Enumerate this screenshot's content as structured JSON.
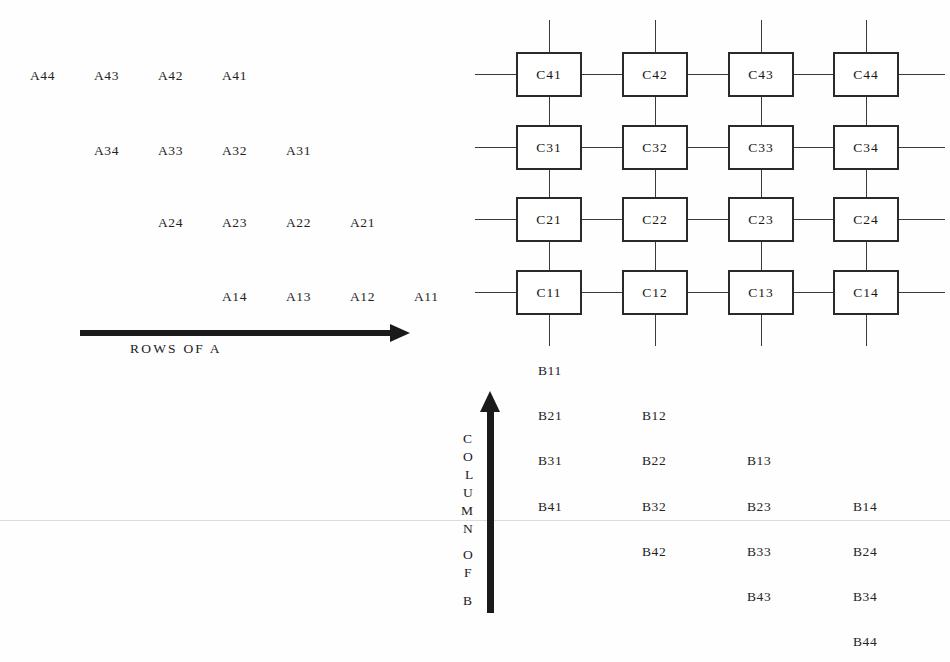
{
  "diagram": {
    "background_color": "#fefefe",
    "ink_color": "#1a1a1a"
  },
  "matrix_a": {
    "label": "ROWS OF A",
    "rows": [
      {
        "elements": [
          "A44",
          "A43",
          "A42",
          "A41"
        ]
      },
      {
        "elements": [
          "A34",
          "A33",
          "A32",
          "A31"
        ]
      },
      {
        "elements": [
          "A24",
          "A23",
          "A22",
          "A21"
        ]
      },
      {
        "elements": [
          "A14",
          "A13",
          "A12",
          "A11"
        ]
      }
    ]
  },
  "matrix_b": {
    "label_letters": [
      "C",
      "O",
      "L",
      "U",
      "M",
      "N",
      "O",
      "F",
      "B"
    ],
    "label_text": "COLUMN OF B",
    "columns": [
      {
        "elements": [
          "B11",
          "B21",
          "B31",
          "B41"
        ]
      },
      {
        "elements": [
          "B12",
          "B22",
          "B32",
          "B42"
        ]
      },
      {
        "elements": [
          "B13",
          "B23",
          "B33",
          "B43"
        ]
      },
      {
        "elements": [
          "B14",
          "B24",
          "B34",
          "B44"
        ]
      }
    ]
  },
  "array_c": {
    "rows": [
      [
        "C41",
        "C42",
        "C43",
        "C44"
      ],
      [
        "C31",
        "C32",
        "C33",
        "C34"
      ],
      [
        "C21",
        "C22",
        "C23",
        "C24"
      ],
      [
        "C11",
        "C12",
        "C13",
        "C14"
      ]
    ]
  }
}
